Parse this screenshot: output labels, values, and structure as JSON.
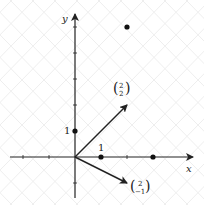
{
  "diagram": {
    "axes": {
      "x_label": "x",
      "y_label": "y",
      "x_range": [
        -3,
        3.5
      ],
      "y_range": [
        -1.5,
        5.5
      ]
    },
    "tick_labels": {
      "x_one": "1",
      "y_one": "1"
    },
    "points": [
      {
        "x": 0,
        "y": 1
      },
      {
        "x": 1,
        "y": 0
      },
      {
        "x": 3,
        "y": 0
      },
      {
        "x": 2,
        "y": 5
      }
    ],
    "vectors": [
      {
        "x": 2,
        "y": 2,
        "top": "2",
        "bottom": "2"
      },
      {
        "x": 2,
        "y": -1,
        "top": "2",
        "bottom": "−1"
      }
    ]
  }
}
